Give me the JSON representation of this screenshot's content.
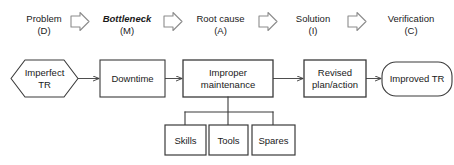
{
  "diagram": {
    "colors": {
      "stroke": "#3a3a3a",
      "text": "#1a1a1a",
      "background": "#ffffff",
      "arrow_outline": "#808080"
    },
    "phases": [
      {
        "name": "Problem",
        "code": "(D)",
        "italic": false
      },
      {
        "name": "Bottleneck",
        "code": "(M)",
        "italic": true
      },
      {
        "name": "Root cause",
        "code": "(A)",
        "italic": false
      },
      {
        "name": "Solution",
        "code": "(I)",
        "italic": false
      },
      {
        "name": "Verification",
        "code": "(C)",
        "italic": false
      }
    ],
    "phase_arrow_icon": "block-arrow-right-icon",
    "nodes": [
      {
        "id": "imperfect-tr",
        "shape": "hexagon",
        "line1": "Imperfect",
        "line2": "TR"
      },
      {
        "id": "downtime",
        "shape": "rect",
        "line1": "Downtime",
        "line2": ""
      },
      {
        "id": "improper-maintenance",
        "shape": "rect",
        "line1": "Improper",
        "line2": "maintenance"
      },
      {
        "id": "revised-plan-action",
        "shape": "rect",
        "line1": "Revised",
        "line2": "plan/action"
      },
      {
        "id": "improved-tr",
        "shape": "stadium",
        "line1": "Improved TR",
        "line2": ""
      }
    ],
    "sub_nodes": [
      {
        "id": "skills",
        "label": "Skills"
      },
      {
        "id": "tools",
        "label": "Tools"
      },
      {
        "id": "spares",
        "label": "Spares"
      }
    ],
    "connector_icon": "arrow-right-icon",
    "bracket_icon": "tree-bracket-connector-icon"
  }
}
